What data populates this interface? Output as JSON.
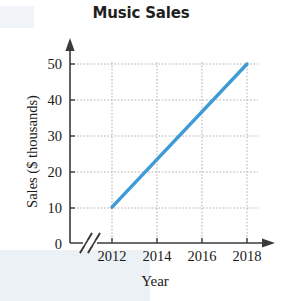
{
  "chart_data": {
    "type": "line",
    "title": "Music Sales",
    "xlabel": "Year",
    "ylabel": "Sales ($ thousands)",
    "x": [
      2012,
      2018
    ],
    "values": [
      10,
      50
    ],
    "series": [
      {
        "name": "Music Sales",
        "points": [
          {
            "x": 2012,
            "y": 10
          },
          {
            "x": 2018,
            "y": 50
          }
        ],
        "color": "#3f9bd6"
      }
    ],
    "x_ticks": [
      "2012",
      "2014",
      "2016",
      "2018"
    ],
    "x_tick_values": [
      2012,
      2014,
      2016,
      2018
    ],
    "y_ticks": [
      "0",
      "10",
      "20",
      "30",
      "40",
      "50"
    ],
    "y_tick_values": [
      0,
      10,
      20,
      30,
      40,
      50
    ],
    "xlim": [
      2012,
      2018
    ],
    "ylim": [
      0,
      50
    ],
    "grid": "dotted",
    "grid_color": "#b9b9b9",
    "axis_color": "#3a3a3a",
    "legend": "none",
    "axis_break": "x-axis double-slash break between origin and 2012",
    "arrows": "both axes end in arrowheads"
  },
  "labels": {
    "title": "Music Sales",
    "y_axis": "Sales ($ thousands)",
    "x_axis": "Year",
    "y0": "0",
    "y10": "10",
    "y20": "20",
    "y30": "30",
    "y40": "40",
    "y50": "50",
    "x2012": "2012",
    "x2014": "2014",
    "x2016": "2016",
    "x2018": "2018"
  }
}
